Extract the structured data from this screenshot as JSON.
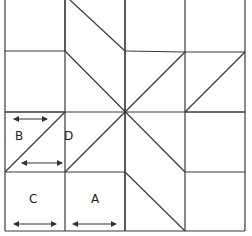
{
  "diagram": {
    "type": "quilt-block-eight-point-star",
    "grid": {
      "cols": 4,
      "rows": 4
    },
    "labels": {
      "a": "A",
      "b": "B",
      "c": "C",
      "d": "D"
    },
    "colors": {
      "line": "#3a3a3a",
      "background": "#ffffff"
    }
  }
}
